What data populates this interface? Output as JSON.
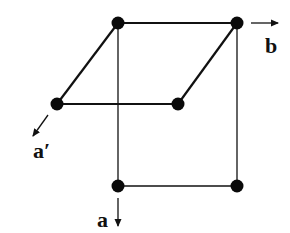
{
  "diagram": {
    "type": "lattice-cell-projection",
    "colors": {
      "line": "#111111",
      "node": "#0a0a0a",
      "background": "#ffffff"
    },
    "nodes": [
      {
        "id": "top-left",
        "x": 118,
        "y": 23
      },
      {
        "id": "top-right",
        "x": 237,
        "y": 23
      },
      {
        "id": "mid-left",
        "x": 57,
        "y": 104
      },
      {
        "id": "mid-right",
        "x": 178,
        "y": 104
      },
      {
        "id": "bottom-left",
        "x": 118,
        "y": 186
      },
      {
        "id": "bottom-right",
        "x": 237,
        "y": 186
      }
    ],
    "edges": [
      {
        "from": "top-left",
        "to": "top-right",
        "weight": "thick"
      },
      {
        "from": "top-left",
        "to": "mid-left",
        "weight": "thick"
      },
      {
        "from": "top-right",
        "to": "mid-right",
        "weight": "thick"
      },
      {
        "from": "mid-left",
        "to": "mid-right",
        "weight": "thick"
      },
      {
        "from": "top-left",
        "to": "bottom-left",
        "weight": "thin"
      },
      {
        "from": "top-right",
        "to": "bottom-right",
        "weight": "thin"
      },
      {
        "from": "bottom-left",
        "to": "bottom-right",
        "weight": "thin"
      }
    ],
    "axes": [
      {
        "id": "b",
        "label": "b",
        "direction": "right"
      },
      {
        "id": "a-prime",
        "label": "a′",
        "direction": "down-left"
      },
      {
        "id": "a",
        "label": "a",
        "direction": "down"
      }
    ]
  }
}
